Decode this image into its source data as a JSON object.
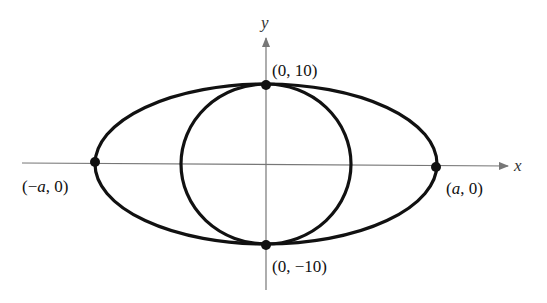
{
  "diagram": {
    "axes": {
      "x_label": "x",
      "y_label": "y",
      "axis_color": "#666666"
    },
    "curves": [
      {
        "name": "ellipse",
        "description": "horizontal ellipse through (-a,0), (a,0), (0,10), (0,-10)"
      },
      {
        "name": "circle",
        "description": "circle of radius 10 centered at origin"
      }
    ],
    "points": [
      {
        "id": "top",
        "label": "(0, 10)"
      },
      {
        "id": "bottom",
        "label": "(0, −10)"
      },
      {
        "id": "left",
        "label_prefix": "(−",
        "label_var": "a",
        "label_suffix": ", 0)"
      },
      {
        "id": "right",
        "label_prefix": "(",
        "label_var": "a",
        "label_suffix": ", 0)"
      }
    ],
    "curve_color": "#111111"
  }
}
